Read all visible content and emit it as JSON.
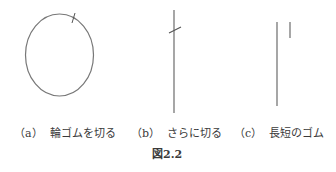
{
  "figure": {
    "label": "図2.2",
    "panels": [
      {
        "marker": "（a）",
        "caption": "輪ゴムを切る",
        "drawing": "closed rubber band ellipse with one cut mark"
      },
      {
        "marker": "（b）",
        "caption": "さらに切る",
        "drawing": "straight cut band with a second cut mark"
      },
      {
        "marker": "（c）",
        "caption": "長短のゴム",
        "drawing": "one long and one short rubber piece"
      }
    ]
  },
  "colors": {
    "line": "#777777",
    "text": "#3a3a3a",
    "background": "#ffffff"
  }
}
